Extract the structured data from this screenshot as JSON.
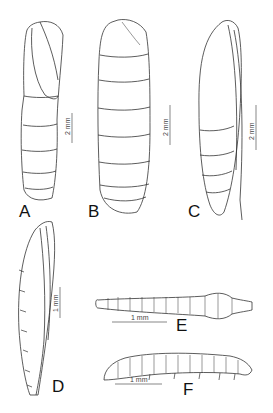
{
  "figure": {
    "panels": [
      {
        "id": "A",
        "label": "A",
        "subject": "pupa, lateral view",
        "scale": "2 mm"
      },
      {
        "id": "B",
        "label": "B",
        "subject": "pupa, dorsal view",
        "scale": "2 mm"
      },
      {
        "id": "C",
        "label": "C",
        "subject": "pupa, lateral view",
        "scale": "2 mm"
      },
      {
        "id": "D",
        "label": "D",
        "subject": "pupa, lateral view",
        "scale": "1 mm"
      },
      {
        "id": "E",
        "label": "E",
        "subject": "larva, dorsal view",
        "scale": "1 mm"
      },
      {
        "id": "F",
        "label": "F",
        "subject": "larva, lateral view",
        "scale": "1 mm"
      }
    ],
    "colors": {
      "ink": "#222222",
      "background": "#ffffff"
    }
  }
}
